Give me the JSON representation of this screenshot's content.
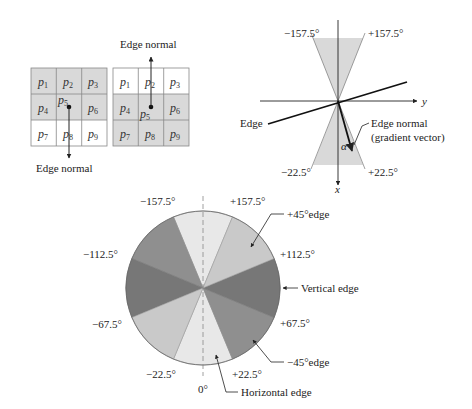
{
  "grids": {
    "left": {
      "cells": [
        "p1",
        "p2",
        "p3",
        "p4",
        "p5",
        "p6",
        "p7",
        "p8",
        "p9"
      ],
      "shaded": [
        true,
        true,
        true,
        true,
        true,
        true,
        false,
        false,
        false
      ],
      "arrow_direction": "down",
      "label": "Edge normal"
    },
    "right": {
      "cells": [
        "p1",
        "p2",
        "p3",
        "p4",
        "p5",
        "p6",
        "p7",
        "p8",
        "p9"
      ],
      "shaded": [
        false,
        false,
        false,
        true,
        true,
        true,
        true,
        true,
        true
      ],
      "arrow_direction": "up",
      "label": "Edge normal"
    },
    "cell_symbol": "p",
    "cell_subscripts": [
      "1",
      "2",
      "3",
      "4",
      "5",
      "6",
      "7",
      "8",
      "9"
    ]
  },
  "axes_diagram": {
    "angle_labels": {
      "top_left": "−157.5°",
      "top_right": "+157.5°",
      "bottom_left": "−22.5°",
      "bottom_right": "+22.5°"
    },
    "x_axis_label": "x",
    "y_axis_label": "y",
    "edge_label": "Edge",
    "normal_label_line1": "Edge normal",
    "normal_label_line2": "(gradient vector)",
    "alpha_label": "α"
  },
  "wheel": {
    "angle_labels": {
      "m157": "−157.5°",
      "p157": "+157.5°",
      "m112": "−112.5°",
      "p112": "+112.5°",
      "m67": "−67.5°",
      "p67": "+67.5°",
      "m22": "−22.5°",
      "p22": "+22.5°",
      "zero": "0°"
    },
    "callouts": {
      "plus45": "+45°edge",
      "vertical": "Vertical edge",
      "minus45": "−45°edge",
      "horizontal": "Horizontal edge"
    },
    "colors": {
      "horizontal": "#e8e8e8",
      "plus45": "#c9c9c9",
      "minus45": "#8f8f8f",
      "vertical": "#777777"
    }
  }
}
